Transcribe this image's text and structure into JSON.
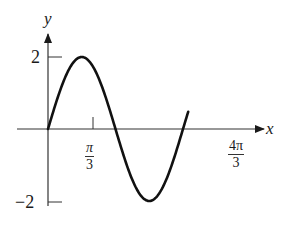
{
  "chart_data": {
    "type": "line",
    "title": "",
    "function": "y = 2 sin(3x/2)",
    "xlabel": "x",
    "ylabel": "y",
    "x_ticks": [
      {
        "value": 1.0472,
        "label_num": "π",
        "label_den": "3"
      },
      {
        "value": 4.1888,
        "label_num": "4π",
        "label_den": "3"
      }
    ],
    "y_ticks": [
      {
        "value": 2,
        "label": "2"
      },
      {
        "value": -2,
        "label": "−2"
      }
    ],
    "xlim": [
      -0.7,
      4.75
    ],
    "ylim": [
      -2.1,
      2.6
    ],
    "grid": false,
    "legend": null,
    "series": [
      {
        "name": "y = 2 sin(3x/2)",
        "x": [
          0,
          0.2618,
          0.5236,
          0.7854,
          1.0472,
          1.309,
          1.5708,
          1.8326,
          2.0944,
          2.3562,
          2.618,
          2.8798,
          3.1416,
          3.4034,
          3.6652,
          3.927,
          4.1888,
          4.35
        ],
        "y": [
          0,
          0.765,
          1.414,
          1.848,
          2,
          1.848,
          1.414,
          0.765,
          0,
          -0.765,
          -1.414,
          -1.848,
          -2,
          -1.848,
          -1.414,
          -0.765,
          0,
          0.47
        ]
      }
    ],
    "key_points": {
      "max": {
        "x": "π/3",
        "y": 2
      },
      "zero_crossing": {
        "x": "2π/3",
        "y": 0
      },
      "min": {
        "x": "π",
        "y": -2
      },
      "period_end": {
        "x": "4π/3",
        "y": 0
      }
    }
  },
  "labels": {
    "y_axis": "y",
    "x_axis": "x",
    "y_tick_top": "2",
    "y_tick_bottom": "−2",
    "x_tick_1_num": "π",
    "x_tick_1_den": "3",
    "x_tick_2_num": "4π",
    "x_tick_2_den": "3"
  },
  "colors": {
    "curve": "#111111",
    "axes": "#333333",
    "background": "#ffffff"
  }
}
